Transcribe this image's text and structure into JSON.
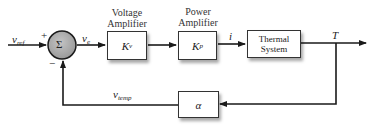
{
  "diagram": {
    "type": "block-diagram",
    "signals": {
      "reference_input": {
        "symbol": "v",
        "subscript": "ref"
      },
      "error": {
        "symbol": "v",
        "subscript": "e"
      },
      "current": {
        "symbol": "i"
      },
      "output": {
        "symbol": "T"
      },
      "feedback": {
        "symbol": "v",
        "subscript": "temp"
      }
    },
    "summing_junction": {
      "symbol": "Σ",
      "plus_sign": "+",
      "minus_sign": "−"
    },
    "blocks": [
      {
        "id": "voltage-amplifier",
        "title_line1": "Voltage",
        "title_line2": "Amplifier",
        "gain_symbol": "K",
        "gain_subscript": "v"
      },
      {
        "id": "power-amplifier",
        "title_line1": "Power",
        "title_line2": "Amplifier",
        "gain_symbol": "K",
        "gain_subscript": "p"
      },
      {
        "id": "thermal-system",
        "label_line1": "Thermal",
        "label_line2": "System"
      },
      {
        "id": "sensor",
        "gain_symbol": "α"
      }
    ],
    "colors": {
      "line": "#1a1a1a",
      "junction_fill": "#a8a8a8",
      "box_border": "#333333",
      "background": "#ffffff"
    }
  }
}
